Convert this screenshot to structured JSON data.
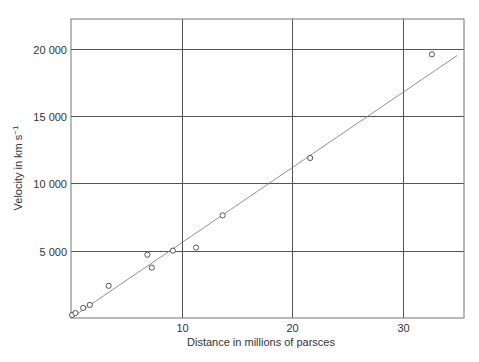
{
  "chart_data": {
    "type": "scatter",
    "title": "",
    "xlabel": "Distance in millions of parsces",
    "ylabel": "Velocity in km s",
    "ylabel_superscript": "−1",
    "xlim": [
      0,
      35.5
    ],
    "ylim": [
      0,
      22200
    ],
    "x_ticks": [
      10,
      20,
      30
    ],
    "x_tick_labels": [
      "10",
      "20",
      "30"
    ],
    "y_ticks": [
      5000,
      10000,
      15000,
      20000
    ],
    "y_tick_labels": [
      "5 000",
      "10 000",
      "15 000",
      "20 000"
    ],
    "grid": true,
    "legend": null,
    "series": [
      {
        "name": "Observed galaxies",
        "marker": "open-circle",
        "points": [
          {
            "x": 0.1,
            "y": 220
          },
          {
            "x": 0.4,
            "y": 370
          },
          {
            "x": 1.1,
            "y": 750
          },
          {
            "x": 1.7,
            "y": 970
          },
          {
            "x": 3.4,
            "y": 2390
          },
          {
            "x": 6.9,
            "y": 4700
          },
          {
            "x": 7.3,
            "y": 3740
          },
          {
            "x": 9.2,
            "y": 5000
          },
          {
            "x": 11.3,
            "y": 5230
          },
          {
            "x": 13.7,
            "y": 7620
          },
          {
            "x": 21.6,
            "y": 11880
          },
          {
            "x": 32.6,
            "y": 19580
          }
        ]
      }
    ],
    "fit_line": {
      "name": "Linear fit",
      "from": {
        "x": 0,
        "y": 0
      },
      "to": {
        "x": 34.9,
        "y": 19500
      }
    }
  },
  "colors": {
    "grid": "#555555",
    "frame": "#777777",
    "text": "#333333",
    "marker": "#444444",
    "fit": "#777777"
  }
}
